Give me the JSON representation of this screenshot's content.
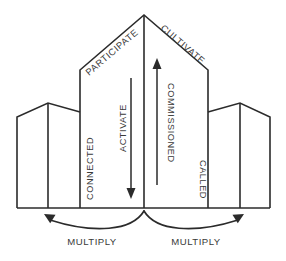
{
  "diagram": {
    "type": "building-flow-diagram",
    "colors": {
      "stroke": "#2b2b2b",
      "text": "#3a3a3a",
      "background": "#ffffff"
    },
    "labels": {
      "roof_left": "PARTICIPATE",
      "roof_right": "CULTIVATE",
      "center_left_vertical": "ACTIVATE",
      "center_right_vertical": "COMMISSIONED",
      "left_building_vertical": "CONNECTED",
      "right_building_vertical": "CALLED",
      "bottom_left": "MULTIPLY",
      "bottom_right": "MULTIPLY"
    },
    "arrows": {
      "activate_direction": "down",
      "commissioned_direction": "up",
      "multiply_left_direction": "up-left",
      "multiply_right_direction": "up-right"
    }
  }
}
